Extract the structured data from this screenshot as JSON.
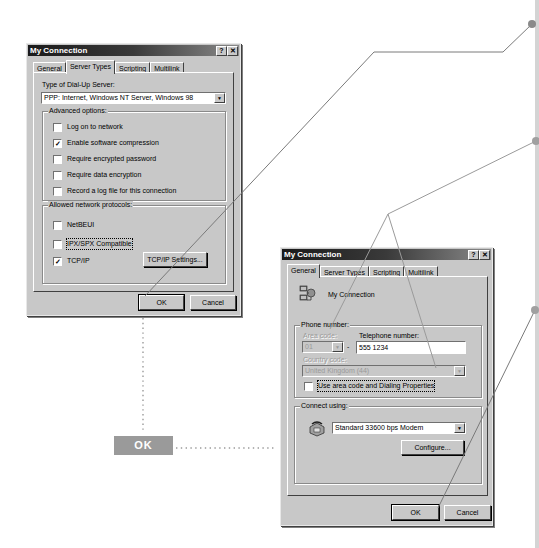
{
  "colors": {
    "dialog_face": "#c8c8c8",
    "titlebar_dark": "#1a1a1a",
    "leader_line": "#888888",
    "callout_dot": "#8a8a8a",
    "ok_badge": "#9a9a9a",
    "right_bar": "#d4d4d4"
  },
  "dialog_server_types": {
    "title": "My Connection",
    "help_button": "?",
    "close_button": "✕",
    "tabs": [
      {
        "label": "General",
        "active": false
      },
      {
        "label": "Server Types",
        "active": true
      },
      {
        "label": "Scripting",
        "active": false
      },
      {
        "label": "Multilink",
        "active": false
      }
    ],
    "server_type_label": "Type of Dial-Up Server:",
    "server_type_value": "PPP: Internet, Windows NT Server, Windows 98",
    "advanced_options": {
      "label": "Advanced options:",
      "items": [
        {
          "label": "Log on to network",
          "checked": false
        },
        {
          "label": "Enable software compression",
          "checked": true
        },
        {
          "label": "Require encrypted password",
          "checked": false
        },
        {
          "label": "Require data encryption",
          "checked": false
        },
        {
          "label": "Record a log file for this connection",
          "checked": false
        }
      ]
    },
    "protocols": {
      "label": "Allowed network protocols:",
      "items": [
        {
          "label": "NetBEUI",
          "checked": false
        },
        {
          "label": "IPX/SPX Compatible",
          "checked": false
        },
        {
          "label": "TCP/IP",
          "checked": true
        }
      ],
      "tcpip_settings_button": "TCP/IP Settings..."
    },
    "ok_button": "OK",
    "cancel_button": "Cancel"
  },
  "dialog_general": {
    "title": "My Connection",
    "help_button": "?",
    "close_button": "✕",
    "tabs": [
      {
        "label": "General",
        "active": true
      },
      {
        "label": "Server Types",
        "active": false
      },
      {
        "label": "Scripting",
        "active": false
      },
      {
        "label": "Multilink",
        "active": false
      }
    ],
    "connection_name": "My Connection",
    "phone_number": {
      "label": "Phone number:",
      "area_code_label": "Area code:",
      "area_code_value": "01",
      "separator": "-",
      "telephone_label": "Telephone number:",
      "telephone_value": "555 1234",
      "country_code_label": "Country code:",
      "country_code_value": "United Kingdom (44)",
      "use_area_code_label": "Use area code and Dialing Properties",
      "use_area_code_checked": false
    },
    "connect_using": {
      "label": "Connect using:",
      "modem_value": "Standard 33600 bps Modem",
      "configure_button": "Configure..."
    },
    "ok_button": "OK",
    "cancel_button": "Cancel"
  },
  "callout": {
    "ok_badge": "OK"
  }
}
